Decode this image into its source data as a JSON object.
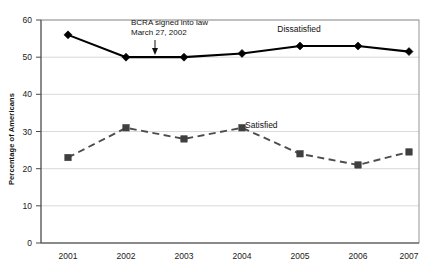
{
  "chart_data": {
    "type": "line",
    "title": "",
    "xlabel": "",
    "ylabel": "Percentage of Americans",
    "categories": [
      "2001",
      "2002",
      "2003",
      "2004",
      "2005",
      "2006",
      "2007"
    ],
    "ylim": [
      0,
      60
    ],
    "yticks": [
      "0",
      "10",
      "20",
      "30",
      "40",
      "50",
      "60"
    ],
    "ytick_values": [
      0,
      10,
      20,
      30,
      40,
      50,
      60
    ],
    "grid": true,
    "legend_position": "inline-labels",
    "series": [
      {
        "name": "Dissatisfied",
        "values": [
          56,
          50,
          50,
          51,
          53,
          53,
          51.5
        ],
        "color": "#000000",
        "style": "solid",
        "marker": "diamond",
        "label_x_category": "2004",
        "label_text": "Dissatisfied"
      },
      {
        "name": "Satisfied",
        "values": [
          23,
          31,
          28,
          31,
          24,
          21,
          24.5
        ],
        "color": "#4d4d4d",
        "style": "dashed",
        "marker": "square",
        "label_x_category": "2004",
        "label_text": "Satisfied"
      }
    ],
    "annotations": [
      {
        "name": "bcra-annotation",
        "line1": "BCRA signed into law",
        "line2": "March 27, 2002",
        "points_to_category": "2002",
        "arrow": "down"
      }
    ]
  },
  "axis": {
    "y_title": "Percentage of Americans",
    "y_ticks": [
      "60",
      "50",
      "40",
      "30",
      "20",
      "10",
      "0"
    ],
    "x_ticks": [
      "2001",
      "2002",
      "2003",
      "2004",
      "2005",
      "2006",
      "2007"
    ]
  },
  "labels": {
    "dissatisfied": "Dissatisfied",
    "satisfied": "Satisfied"
  },
  "annotation": {
    "line1": "BCRA signed into law",
    "line2": "March 27, 2002"
  },
  "colors": {
    "dissatisfied": "#000000",
    "satisfied": "#4d4d4d",
    "grid": "#c9c9c9",
    "border": "#8a8a8a",
    "background": "#ffffff"
  }
}
